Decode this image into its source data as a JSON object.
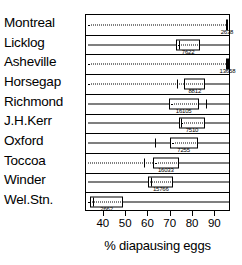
{
  "chart_data": {
    "type": "boxplot",
    "title": "",
    "xlabel": "% diapausing eggs",
    "ylabel": "",
    "xlim": [
      32,
      97
    ],
    "xticks": [
      40,
      50,
      60,
      70,
      80,
      90
    ],
    "xticklabels": [
      "40",
      "50",
      "60",
      "70",
      "80",
      "90"
    ],
    "grid": false,
    "legend": null,
    "orientation": "horizontal",
    "categories": [
      "Montreal",
      "Licklog",
      "Asheville",
      "Horsegap",
      "Richmond",
      "J.H.Kerr",
      "Oxford",
      "Toccoa",
      "Winder",
      "Wel.Stn."
    ],
    "series": [
      {
        "name": "Montreal",
        "n": "2638",
        "whisker_low": 33,
        "whisker_high": 95.8,
        "q1": 94.6,
        "median": 95.2,
        "q3": 95.8,
        "low_dotted": true
      },
      {
        "name": "Licklog",
        "n": "7622",
        "whisker_low": 33,
        "whisker_high": 96,
        "q1": 72.5,
        "median": 73.5,
        "q3": 83,
        "low_dotted": false
      },
      {
        "name": "Asheville",
        "n": "13658",
        "whisker_low": 33,
        "whisker_high": 96,
        "q1": 94.8,
        "median": 95.4,
        "q3": 96,
        "low_dotted": true
      },
      {
        "name": "Horsegap",
        "n": "8812",
        "whisker_low": 33,
        "whisker_high": 96,
        "q1": 76,
        "median": 72.6,
        "q3": 85.5,
        "low_dotted": true
      },
      {
        "name": "Richmond",
        "n": "16105",
        "whisker_low": 33,
        "whisker_high": 96,
        "q1": 69,
        "median": 86,
        "q3": 82.5,
        "low_dotted": false
      },
      {
        "name": "J.H.Kerr",
        "n": "7510",
        "whisker_low": 33,
        "whisker_high": 96,
        "q1": 73.5,
        "median": 74.5,
        "q3": 85.5,
        "low_dotted": false
      },
      {
        "name": "Oxford",
        "n": "7255",
        "whisker_low": 33,
        "whisker_high": 96,
        "q1": 69.5,
        "median": 63,
        "q3": 82,
        "low_dotted": false
      },
      {
        "name": "Toccoa",
        "n": "16033",
        "whisker_low": 33,
        "whisker_high": 96,
        "q1": 62,
        "median": 58,
        "q3": 73.5,
        "low_dotted": true
      },
      {
        "name": "Winder",
        "n": "15766",
        "whisker_low": 33,
        "whisker_high": 96,
        "q1": 60,
        "median": 61,
        "q3": 71,
        "low_dotted": false
      },
      {
        "name": "Wel.Stn.",
        "n": "2662",
        "whisker_low": 33,
        "whisker_high": 96,
        "q1": 34,
        "median": 35,
        "q3": 48.5,
        "low_dotted": true
      }
    ]
  }
}
